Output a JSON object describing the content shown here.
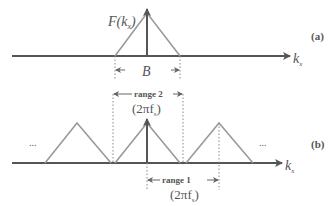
{
  "diagram": {
    "panel_a": {
      "label": "(a)",
      "function_label": "F(k",
      "function_sub": "x",
      "function_close": ")",
      "bandwidth_label": "B",
      "axis_label": "k",
      "axis_sub": "x"
    },
    "panel_b": {
      "label": "(b)",
      "range2_label": "range 2",
      "range2_formula": "(2πf",
      "range2_sub": "s",
      "range2_close": ")",
      "range1_label": "range 1",
      "range1_formula": "(2πf",
      "range1_sub": "s",
      "range1_close": ")",
      "ellipsis_left": "...",
      "ellipsis_right": "...",
      "axis_label": "k",
      "axis_sub": "x"
    },
    "colors": {
      "axis": "#555555",
      "triangle": "#9a9a9a",
      "dotted": "#888888",
      "text": "#555555"
    }
  }
}
